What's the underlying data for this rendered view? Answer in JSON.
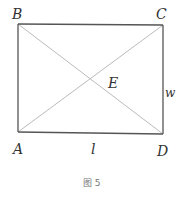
{
  "diagram": {
    "type": "rectangle-with-diagonals",
    "points": {
      "A": {
        "label": "A",
        "x": 18,
        "y": 132
      },
      "B": {
        "label": "B",
        "x": 18,
        "y": 24
      },
      "C": {
        "label": "C",
        "x": 163,
        "y": 25
      },
      "D": {
        "label": "D",
        "x": 163,
        "y": 134
      },
      "E": {
        "label": "E"
      }
    },
    "side_labels": {
      "length": "l",
      "width": "w"
    },
    "caption": "图 5",
    "colors": {
      "sides": "#555555",
      "diagonals": "#bbbbbb",
      "labels": "#333333"
    }
  }
}
